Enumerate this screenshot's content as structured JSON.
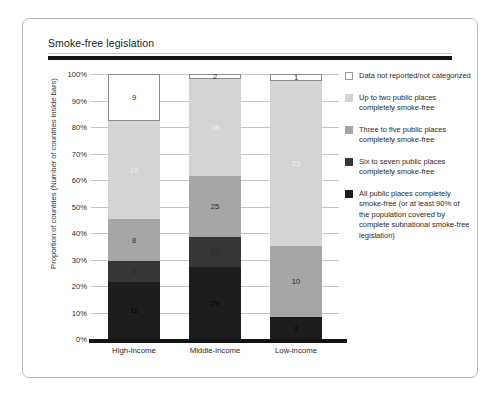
{
  "panel": {
    "title": "Smoke-free legislation"
  },
  "chart_data": {
    "type": "bar",
    "stacked": true,
    "stack_mode": "percent",
    "title": "Smoke-free legislation",
    "xlabel": "",
    "ylabel": "Proportion of countries (Number of countries inside bars)",
    "ylim": [
      0,
      100
    ],
    "yticks": [
      "0%",
      "10%",
      "20%",
      "30%",
      "40%",
      "50%",
      "60%",
      "70%",
      "80%",
      "90%",
      "100%"
    ],
    "grid": true,
    "legend_position": "right",
    "categories": [
      "High-income",
      "Middle-income",
      "Low-income"
    ],
    "category_totals": [
      51,
      107,
      37
    ],
    "series": [
      {
        "name": "All public places completely smoke-free (or at least 90% of the population covered by complete subnational smoke-free legislation)",
        "key": "all-public-places",
        "color": "#1d1d1d",
        "values": [
          11,
          29,
          3
        ],
        "percents": [
          21.6,
          27.1,
          8.1
        ]
      },
      {
        "name": "Six to seven public places completely smoke-free",
        "key": "six-to-seven",
        "color": "#363636",
        "values": [
          4,
          12,
          0
        ],
        "percents": [
          7.8,
          11.2,
          0
        ]
      },
      {
        "name": "Three to five public places completely smoke-free",
        "key": "three-to-five",
        "color": "#a6a6a6",
        "values": [
          8,
          25,
          10
        ],
        "percents": [
          15.7,
          23.4,
          27.0
        ]
      },
      {
        "name": "Up to two public places completely smoke-free",
        "key": "up-to-two",
        "color": "#d4d4d4",
        "values": [
          19,
          39,
          23
        ],
        "percents": [
          37.3,
          36.4,
          62.2
        ]
      },
      {
        "name": "Data not reported/not categorized",
        "key": "not-reported",
        "color": "#ffffff",
        "values": [
          9,
          2,
          1
        ],
        "percents": [
          17.6,
          1.9,
          2.7
        ]
      }
    ]
  },
  "legend": {
    "items": [
      {
        "label": "Data not reported/not categorized",
        "swatch": "#ffffff",
        "outlined": true
      },
      {
        "label": "Up to two public places completely smoke-free",
        "swatch": "#d4d4d4",
        "outlined": false
      },
      {
        "label": "Three to five public places completely smoke-free",
        "swatch": "#a6a6a6",
        "outlined": false
      },
      {
        "label": "Six to seven public places completely smoke-free",
        "swatch": "#363636",
        "outlined": false
      },
      {
        "label": "All public places completely smoke-free (or at least 90% of the population covered by complete subnational smoke-free legislation)",
        "swatch": "#1d1d1d",
        "outlined": false
      }
    ]
  }
}
